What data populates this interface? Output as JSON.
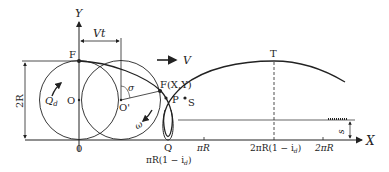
{
  "diagram": {
    "type": "trochoid-trajectory",
    "axes": {
      "x_label": "X",
      "y_label": "Y",
      "origin_label": "0"
    },
    "points": {
      "F_start": "F",
      "F_moving": "F(X,Y)",
      "P": "P",
      "S": "S",
      "Q": "Q",
      "T": "T",
      "O": "O",
      "O_prime": "O'"
    },
    "dimensions": {
      "height": "2R",
      "displacement": "Vt",
      "s": "s"
    },
    "velocity_label": "V",
    "angle_label": "σ",
    "rotation_label": "ω",
    "flow_label": "Q",
    "flow_subscript": "d",
    "ticks": {
      "q_tick": "πR(1 − i",
      "q_tick_sub": "d",
      "q_tick_end": ")",
      "pi_r": "πR",
      "t_tick": "2πR(1 − i",
      "t_tick_sub": "d",
      "t_tick_end": ")",
      "two_pi_r": "2πR"
    },
    "colors": {
      "line": "#222222",
      "background": "#ffffff"
    }
  }
}
